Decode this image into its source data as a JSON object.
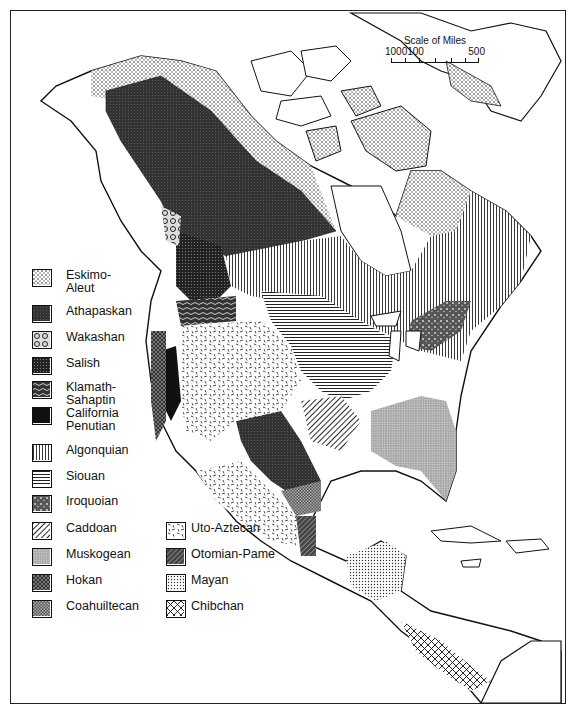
{
  "map": {
    "subject": "Native American language families of North America",
    "scale": {
      "title": "Scale of Miles",
      "ticks": [
        "100",
        "0",
        "100",
        "500"
      ]
    }
  },
  "legend": {
    "items": [
      {
        "id": "eskimo-aleut",
        "label": "Eskimo-Aleut",
        "line1": "Eskimo-",
        "line2": "Aleut",
        "pattern": "coarse-stipple"
      },
      {
        "id": "athapaskan",
        "label": "Athapaskan",
        "pattern": "dark-fine-dots"
      },
      {
        "id": "wakashan",
        "label": "Wakashan",
        "pattern": "swirls"
      },
      {
        "id": "salish",
        "label": "Salish",
        "pattern": "dark-dots"
      },
      {
        "id": "klamath-sahaptin",
        "label": "Klamath-Sahaptin",
        "line1": "Klamath-",
        "line2": "Sahaptin",
        "pattern": "wavy-lines"
      },
      {
        "id": "california-penutian",
        "label": "California Penutian",
        "line1": "California",
        "line2": "Penutian",
        "pattern": "solid-black"
      },
      {
        "id": "algonquian",
        "label": "Algonquian",
        "pattern": "vertical-lines"
      },
      {
        "id": "siouan",
        "label": "Siouan",
        "pattern": "horizontal-lines"
      },
      {
        "id": "iroquoian",
        "label": "Iroquoian",
        "pattern": "mottled"
      },
      {
        "id": "caddoan",
        "label": "Caddoan",
        "pattern": "diagonal-lines"
      },
      {
        "id": "muskogean",
        "label": "Muskogean",
        "pattern": "light-grey-dots"
      },
      {
        "id": "hokan",
        "label": "Hokan",
        "pattern": "dark-checker"
      },
      {
        "id": "coahuiltecan",
        "label": "Coahuiltecan",
        "pattern": "medium-checker"
      },
      {
        "id": "uto-aztecan",
        "label": "Uto-Aztecan",
        "pattern": "dashes"
      },
      {
        "id": "otomian-pame",
        "label": "Otomian-Pame",
        "pattern": "dark-diagonal"
      },
      {
        "id": "mayan",
        "label": "Mayan",
        "pattern": "light-dots"
      },
      {
        "id": "chibchan",
        "label": "Chibchan",
        "pattern": "crosshatch"
      }
    ]
  }
}
